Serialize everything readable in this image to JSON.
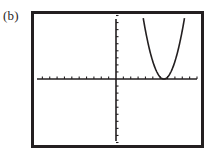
{
  "figure": {
    "label": "(b)"
  },
  "colors": {
    "ink": "#231f20",
    "background": "#ffffff"
  },
  "chart_data": {
    "type": "line",
    "title": "",
    "xlabel": "",
    "ylabel": "",
    "xlim": [
      -11,
      11
    ],
    "ylim": [
      -9,
      9
    ],
    "xscl": 1,
    "yscl": 1,
    "grid": false,
    "legend": null,
    "series": [
      {
        "name": "parabola",
        "function": "y = 1.1*(x - 6.5)^2",
        "vertex": [
          6.5,
          0
        ],
        "x": [
          1.5,
          2.5,
          3.5,
          4.5,
          5.5,
          6.5,
          7.5,
          8.5,
          9.5,
          10.5,
          11
        ],
        "y": [
          27.5,
          17.6,
          9.9,
          4.4,
          1.1,
          0,
          1.1,
          4.4,
          9.9,
          17.6,
          22.3
        ]
      }
    ],
    "annotations": [
      "(b)"
    ]
  }
}
